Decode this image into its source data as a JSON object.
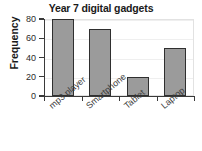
{
  "chart_data": {
    "type": "bar",
    "title": "Year 7 digital gadgets",
    "xlabel": "",
    "ylabel": "Frequency",
    "categories": [
      "mp3 player",
      "Smartphone",
      "Tablet",
      "Laptop"
    ],
    "values": [
      80,
      70,
      20,
      50
    ],
    "ylim": [
      0,
      80
    ],
    "yticks": [
      0,
      20,
      40,
      60,
      80
    ],
    "ytick_labels": [
      "0",
      "20",
      "40",
      "60",
      "80"
    ],
    "grid": true,
    "legend": null,
    "bar_color": "#9b9b9b",
    "bar_border_color": "#2f2f2f",
    "axis_color": "#3a3a3a",
    "background": "#ffffff"
  }
}
